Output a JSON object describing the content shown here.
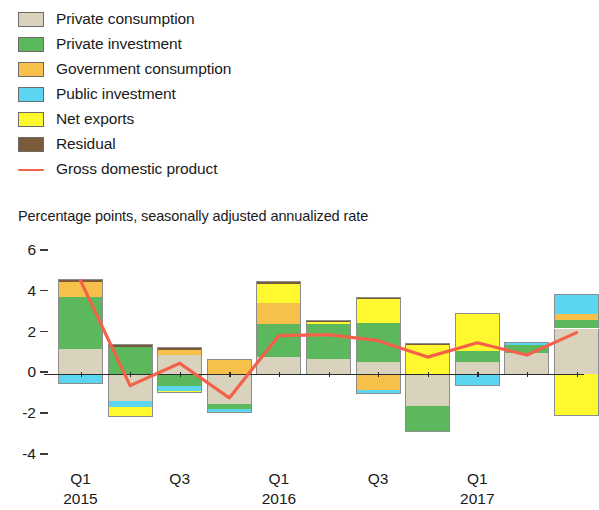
{
  "legend": {
    "items": [
      {
        "label": "Private consumption",
        "color": "#d9d2bd",
        "type": "swatch",
        "name": "private-consumption"
      },
      {
        "label": "Private investment",
        "color": "#5cb85c",
        "type": "swatch",
        "name": "private-investment"
      },
      {
        "label": "Government consumption",
        "color": "#f7c04a",
        "type": "swatch",
        "name": "government-consumption"
      },
      {
        "label": "Public investment",
        "color": "#5bd5f0",
        "type": "swatch",
        "name": "public-investment"
      },
      {
        "label": "Net exports",
        "color": "#fff82e",
        "type": "swatch",
        "name": "net-exports"
      },
      {
        "label": "Residual",
        "color": "#7a5a38",
        "type": "swatch",
        "name": "residual"
      },
      {
        "label": "Gross domestic product",
        "color": "#f4614a",
        "type": "line",
        "name": "gross-domestic-product"
      }
    ]
  },
  "subtitle": "Percentage points, seasonally adjusted annualized rate",
  "chart_data": {
    "type": "bar",
    "subtype": "stacked-bar-with-line-overlay",
    "title": "",
    "subtitle": "Percentage points, seasonally adjusted annualized rate",
    "xlabel": "",
    "ylabel": "Percentage points, seasonally adjusted annualized rate",
    "ylim": [
      -4,
      6
    ],
    "yticks": [
      6,
      4,
      2,
      0,
      -2,
      -4
    ],
    "ytick_labels": [
      "6",
      "4",
      "2",
      "0",
      "-2",
      "-4"
    ],
    "grid": false,
    "legend_position": "top-left",
    "stacked": true,
    "x": [
      "Q1 2015",
      "Q2 2015",
      "Q3 2015",
      "Q4 2015",
      "Q1 2016",
      "Q2 2016",
      "Q3 2016",
      "Q4 2016",
      "Q1 2017",
      "Q2 2017",
      "Q3 2017"
    ],
    "xtick_labels": [
      {
        "q": "Q1",
        "year": "2015",
        "index": 0
      },
      {
        "q": "Q3",
        "year": "",
        "index": 2
      },
      {
        "q": "Q1",
        "year": "2016",
        "index": 4
      },
      {
        "q": "Q3",
        "year": "",
        "index": 6
      },
      {
        "q": "Q1",
        "year": "2017",
        "index": 8
      }
    ],
    "series": [
      {
        "name": "Private consumption",
        "color": "#d9d2bd",
        "values": [
          1.25,
          -1.3,
          0.95,
          -1.45,
          0.85,
          0.75,
          0.6,
          -1.55,
          0.6,
          1.05,
          2.25
        ]
      },
      {
        "name": "Private investment",
        "color": "#5cb85c",
        "values": [
          2.55,
          1.35,
          -0.55,
          -0.25,
          1.6,
          1.7,
          1.9,
          -1.25,
          0.55,
          0.4,
          0.4
        ]
      },
      {
        "name": "Government consumption",
        "color": "#f7c04a",
        "values": [
          0.75,
          0.0,
          0.25,
          0.75,
          1.05,
          0.0,
          -0.75,
          0.0,
          0.0,
          0.0,
          0.3
        ]
      },
      {
        "name": "Public investment",
        "color": "#5bd5f0",
        "values": [
          -0.45,
          -0.3,
          -0.25,
          -0.2,
          0.0,
          0.0,
          -0.2,
          0.0,
          -0.55,
          0.15,
          1.0
        ]
      },
      {
        "name": "Net exports",
        "color": "#fff82e",
        "values": [
          0.0,
          -0.5,
          -0.1,
          0.0,
          0.95,
          0.1,
          1.2,
          1.45,
          1.85,
          0.0,
          -2.05
        ]
      },
      {
        "name": "Residual",
        "color": "#7a5a38",
        "values": [
          0.15,
          0.15,
          0.15,
          0.0,
          0.15,
          0.1,
          0.1,
          0.1,
          0.0,
          0.0,
          0.0
        ]
      }
    ],
    "line_series": {
      "name": "Gross domestic product",
      "color": "#f4614a",
      "values": [
        4.6,
        -0.55,
        0.55,
        -1.15,
        1.9,
        1.95,
        1.65,
        0.85,
        1.55,
        0.95,
        2.05
      ]
    }
  }
}
